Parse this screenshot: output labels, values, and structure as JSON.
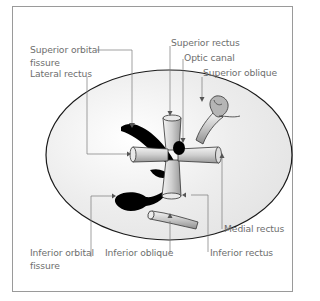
{
  "figure": {
    "labels": {
      "superior_orbital_fissure": [
        "Superior orbital",
        "fissure"
      ],
      "lateral_rectus": "Lateral rectus",
      "superior_rectus": "Superior rectus",
      "optic_canal": "Optic canal",
      "superior_oblique": "Superior oblique",
      "medial_rectus": "Medial rectus",
      "inferior_rectus": "Inferior rectus",
      "inferior_oblique": "Inferior oblique",
      "inferior_orbital_fissure": [
        "Inferior orbital",
        "fissure"
      ]
    },
    "colors": {
      "frame": "#9a9a9a",
      "outline": "#1a1a1a",
      "fissure_fill": "#000000",
      "muscle_light": "#f2f2f2",
      "muscle_dark": "#9c9c9c",
      "leader_line": "#7a7a7a",
      "label_text": "#6e6e6e"
    }
  }
}
